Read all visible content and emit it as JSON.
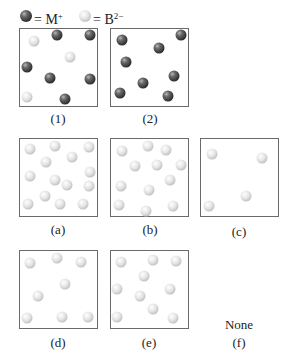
{
  "legend": {
    "metal": {
      "symbol": "M",
      "charge": "+",
      "text": "= M",
      "color": "dark"
    },
    "anion": {
      "symbol": "B",
      "charge": "2−",
      "text": "= B",
      "color": "light"
    }
  },
  "colors": {
    "dark_ball": "#4a4a4a",
    "light_ball": "#d9d9d9",
    "box_border": "#6a6a6a"
  },
  "panels": [
    {
      "id": "1",
      "label": "(1)",
      "box": [
        19,
        28,
        79,
        79
      ],
      "label_pos": [
        58,
        112
      ],
      "balls": [
        {
          "t": "light",
          "x": 34,
          "y": 41
        },
        {
          "t": "dark",
          "x": 57,
          "y": 35
        },
        {
          "t": "dark",
          "x": 90,
          "y": 35
        },
        {
          "t": "light",
          "x": 70,
          "y": 57
        },
        {
          "t": "dark",
          "x": 27,
          "y": 67
        },
        {
          "t": "dark",
          "x": 50,
          "y": 78
        },
        {
          "t": "dark",
          "x": 90,
          "y": 79
        },
        {
          "t": "light",
          "x": 27,
          "y": 97
        },
        {
          "t": "dark",
          "x": 65,
          "y": 99
        }
      ]
    },
    {
      "id": "2",
      "label": "(2)",
      "box": [
        110,
        28,
        79,
        79
      ],
      "label_pos": [
        150,
        112
      ],
      "balls": [
        {
          "t": "dark",
          "x": 122,
          "y": 40
        },
        {
          "t": "dark",
          "x": 181,
          "y": 35
        },
        {
          "t": "dark",
          "x": 159,
          "y": 48
        },
        {
          "t": "dark",
          "x": 126,
          "y": 62
        },
        {
          "t": "dark",
          "x": 174,
          "y": 76
        },
        {
          "t": "dark",
          "x": 143,
          "y": 83
        },
        {
          "t": "dark",
          "x": 120,
          "y": 93
        },
        {
          "t": "dark",
          "x": 168,
          "y": 96
        }
      ]
    },
    {
      "id": "a",
      "label": "(a)",
      "box": [
        19,
        138,
        79,
        79
      ],
      "label_pos": [
        58,
        223
      ],
      "balls": [
        {
          "t": "light",
          "x": 30,
          "y": 149
        },
        {
          "t": "light",
          "x": 55,
          "y": 146
        },
        {
          "t": "light",
          "x": 89,
          "y": 147
        },
        {
          "t": "light",
          "x": 46,
          "y": 162
        },
        {
          "t": "light",
          "x": 72,
          "y": 157
        },
        {
          "t": "light",
          "x": 30,
          "y": 176
        },
        {
          "t": "light",
          "x": 55,
          "y": 180
        },
        {
          "t": "light",
          "x": 67,
          "y": 185
        },
        {
          "t": "light",
          "x": 90,
          "y": 172
        },
        {
          "t": "light",
          "x": 89,
          "y": 186
        },
        {
          "t": "light",
          "x": 45,
          "y": 196
        },
        {
          "t": "light",
          "x": 28,
          "y": 204
        },
        {
          "t": "light",
          "x": 60,
          "y": 204
        },
        {
          "t": "light",
          "x": 83,
          "y": 204
        }
      ]
    },
    {
      "id": "b",
      "label": "(b)",
      "box": [
        110,
        138,
        79,
        79
      ],
      "label_pos": [
        150,
        223
      ],
      "balls": [
        {
          "t": "light",
          "x": 122,
          "y": 151
        },
        {
          "t": "light",
          "x": 148,
          "y": 146
        },
        {
          "t": "light",
          "x": 166,
          "y": 150
        },
        {
          "t": "light",
          "x": 135,
          "y": 166
        },
        {
          "t": "light",
          "x": 157,
          "y": 165
        },
        {
          "t": "light",
          "x": 181,
          "y": 165
        },
        {
          "t": "light",
          "x": 170,
          "y": 180
        },
        {
          "t": "light",
          "x": 121,
          "y": 186
        },
        {
          "t": "light",
          "x": 149,
          "y": 190
        },
        {
          "t": "light",
          "x": 119,
          "y": 205
        },
        {
          "t": "light",
          "x": 146,
          "y": 211
        },
        {
          "t": "light",
          "x": 173,
          "y": 206
        }
      ]
    },
    {
      "id": "c",
      "label": "(c)",
      "box": [
        200,
        138,
        79,
        79
      ],
      "label_pos": [
        239,
        225
      ],
      "balls": [
        {
          "t": "light",
          "x": 212,
          "y": 154
        },
        {
          "t": "light",
          "x": 262,
          "y": 158
        },
        {
          "t": "light",
          "x": 246,
          "y": 196
        },
        {
          "t": "light",
          "x": 209,
          "y": 206
        }
      ]
    },
    {
      "id": "d",
      "label": "(d)",
      "box": [
        19,
        250,
        79,
        79
      ],
      "label_pos": [
        58,
        336
      ],
      "balls": [
        {
          "t": "light",
          "x": 30,
          "y": 263
        },
        {
          "t": "light",
          "x": 57,
          "y": 258
        },
        {
          "t": "light",
          "x": 81,
          "y": 262
        },
        {
          "t": "light",
          "x": 65,
          "y": 284
        },
        {
          "t": "light",
          "x": 38,
          "y": 296
        },
        {
          "t": "light",
          "x": 27,
          "y": 318
        },
        {
          "t": "light",
          "x": 62,
          "y": 317
        },
        {
          "t": "light",
          "x": 88,
          "y": 317
        }
      ]
    },
    {
      "id": "e",
      "label": "(e)",
      "box": [
        110,
        250,
        79,
        79
      ],
      "label_pos": [
        149,
        336
      ],
      "balls": [
        {
          "t": "light",
          "x": 121,
          "y": 262
        },
        {
          "t": "light",
          "x": 153,
          "y": 260
        },
        {
          "t": "light",
          "x": 176,
          "y": 261
        },
        {
          "t": "light",
          "x": 144,
          "y": 276
        },
        {
          "t": "light",
          "x": 117,
          "y": 289
        },
        {
          "t": "light",
          "x": 170,
          "y": 289
        },
        {
          "t": "light",
          "x": 140,
          "y": 296
        },
        {
          "t": "light",
          "x": 153,
          "y": 309
        },
        {
          "t": "light",
          "x": 117,
          "y": 317
        },
        {
          "t": "light",
          "x": 173,
          "y": 318
        }
      ]
    }
  ],
  "option_f": {
    "label": "(f)",
    "text": "None",
    "label_pos": [
      239,
      336
    ],
    "text_pos": [
      239,
      318
    ]
  }
}
